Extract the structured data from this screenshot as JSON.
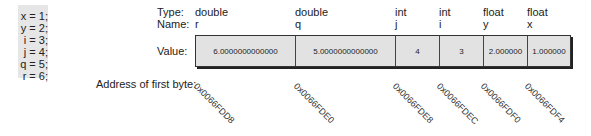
{
  "code": {
    "lines": [
      "x = 1;",
      "y = 2;",
      "i = 3;",
      "j = 4;",
      "q = 5;",
      "r = 6;"
    ]
  },
  "labels": {
    "type": "Type:",
    "name": "Name:",
    "value": "Value:",
    "address": "Address of first byte:"
  },
  "memory": [
    {
      "type": "double",
      "name": "r",
      "value": "6.0000000000000",
      "address": "0x0066FDD8"
    },
    {
      "type": "double",
      "name": "q",
      "value": "5.0000000000000",
      "address": "0x0066FDE0"
    },
    {
      "type": "int",
      "name": "j",
      "value": "4",
      "address": "0x0066FDE8"
    },
    {
      "type": "int",
      "name": "i",
      "value": "3",
      "address": "0x0066FDEC"
    },
    {
      "type": "float",
      "name": "y",
      "value": "2.000000",
      "address": "0x0066FDF0"
    },
    {
      "type": "float",
      "name": "x",
      "value": "1.000000",
      "address": "0x0066FDF4"
    }
  ],
  "colors": {
    "cell_fill": "#e2e2e2",
    "code_panel_fill": "#e6e6e6",
    "border": "#333333"
  }
}
